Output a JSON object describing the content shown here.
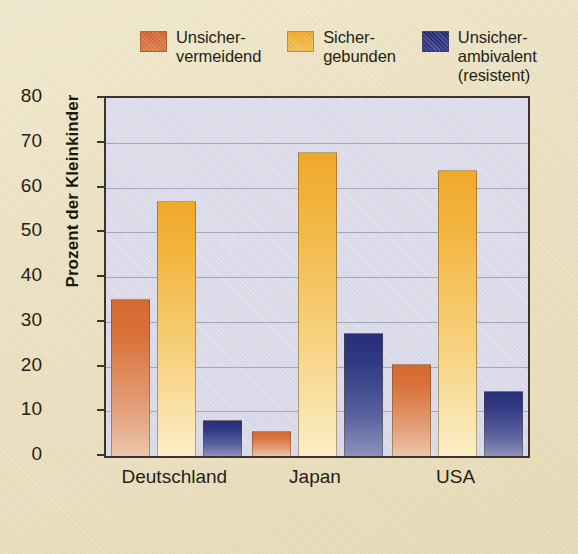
{
  "chart_data": {
    "type": "bar",
    "title": "",
    "xlabel": "",
    "ylabel": "Prozent der Kleinkinder",
    "ylim": [
      0,
      80
    ],
    "yticks": [
      0,
      10,
      20,
      30,
      40,
      50,
      60,
      70,
      80
    ],
    "grid": true,
    "legend_position": "top",
    "categories": [
      "Deutschland",
      "Japan",
      "USA"
    ],
    "series": [
      {
        "name": "Unsicher-\nvermeidend",
        "color": "#d9723a",
        "values": [
          35,
          5.5,
          20.5
        ]
      },
      {
        "name": "Sicher-\ngebunden",
        "color": "#f0b23c",
        "values": [
          57,
          68,
          64
        ]
      },
      {
        "name": "Unsicher-\nambivalent\n(resistent)",
        "color": "#2c3480",
        "values": [
          8,
          27.5,
          14.5
        ]
      }
    ]
  },
  "figure": {
    "background_color": "#ece2c4",
    "plot_background_color": "#d7d7e7",
    "axis_color": "#3a342c"
  }
}
